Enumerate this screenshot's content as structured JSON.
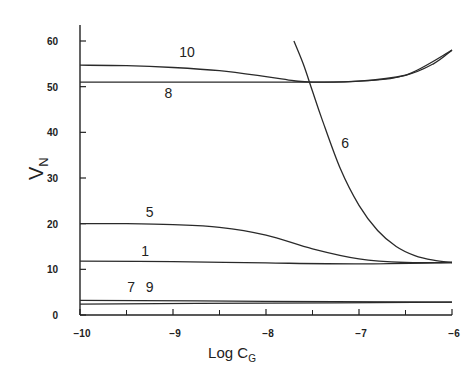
{
  "chart_data": {
    "type": "line",
    "title": "",
    "xlabel": "Log C",
    "xlabel_subscript": "G",
    "ylabel": "V",
    "ylabel_subscript": "N",
    "xlim": [
      -10,
      -6
    ],
    "ylim": [
      0,
      60
    ],
    "x_ticks": [
      -10,
      -9,
      -8,
      -7,
      -6
    ],
    "x_tick_labels": [
      "-10",
      "-9",
      "-8",
      "-7",
      "-6"
    ],
    "x_minor_ticks": [
      -9.5,
      -8.5,
      -7.5,
      -6.5
    ],
    "y_ticks": [
      0,
      10,
      20,
      30,
      40,
      50,
      60
    ],
    "y_tick_labels": [
      "0",
      "10",
      "20",
      "30",
      "40",
      "50",
      "60"
    ],
    "grid": false,
    "legend": "inline curve labels",
    "series": [
      {
        "name": "10",
        "x": [
          -10,
          -9.5,
          -9,
          -8.5,
          -8,
          -7.7,
          -7.5,
          -7,
          -6.5,
          -6.2,
          -6
        ],
        "y": [
          54.7,
          54.6,
          54.2,
          53.5,
          52.2,
          51.3,
          51.0,
          51.2,
          52.5,
          55.0,
          58.0
        ]
      },
      {
        "name": "8",
        "x": [
          -10,
          -9,
          -8,
          -7.5,
          -7,
          -6.5,
          -6
        ],
        "y": [
          51.0,
          51.0,
          51.0,
          51.0,
          51.2,
          52.5,
          58.0
        ]
      },
      {
        "name": "6",
        "x": [
          -7.7,
          -7.6,
          -7.5,
          -7.4,
          -7.2,
          -7.0,
          -6.8,
          -6.6,
          -6.4,
          -6.2,
          -6.0
        ],
        "y": [
          60.0,
          55.0,
          49.0,
          43.0,
          32.0,
          24.0,
          18.5,
          15.0,
          13.0,
          12.0,
          11.5
        ]
      },
      {
        "name": "5",
        "x": [
          -10,
          -9.5,
          -9,
          -8.5,
          -8,
          -7.5,
          -7,
          -6.5,
          -6
        ],
        "y": [
          20.0,
          20.0,
          19.8,
          19.2,
          17.5,
          14.5,
          12.3,
          11.5,
          11.5
        ]
      },
      {
        "name": "1",
        "x": [
          -10,
          -9,
          -8,
          -7,
          -6
        ],
        "y": [
          11.8,
          11.7,
          11.4,
          11.2,
          11.5
        ]
      },
      {
        "name": "7",
        "x": [
          -10,
          -8,
          -6
        ],
        "y": [
          3.2,
          3.0,
          2.8
        ]
      },
      {
        "name": "9",
        "x": [
          -10,
          -8,
          -6
        ],
        "y": [
          2.4,
          2.6,
          2.8
        ]
      }
    ],
    "annotations": [
      {
        "text": "10",
        "x": -8.85,
        "y": 56.5
      },
      {
        "text": "8",
        "x": -9.05,
        "y": 47.5
      },
      {
        "text": "6",
        "x": -7.15,
        "y": 36.5
      },
      {
        "text": "5",
        "x": -9.25,
        "y": 21.5
      },
      {
        "text": "1",
        "x": -9.3,
        "y": 13.0
      },
      {
        "text": "7",
        "x": -9.45,
        "y": 5.0
      },
      {
        "text": "9",
        "x": -9.25,
        "y": 5.0
      }
    ]
  }
}
